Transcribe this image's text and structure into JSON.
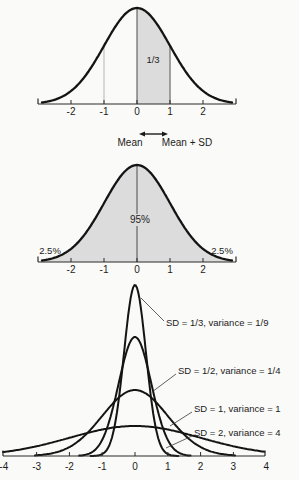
{
  "figure": {
    "background": "#fafaf8",
    "curve_color": "#141414",
    "shade_color": "#dcdcdc",
    "text_color": "#1c1c1c"
  },
  "panel1": {
    "area_label": "1/3",
    "mean_label": "Mean",
    "mean_plus_sd_label": "Mean + SD",
    "ticks": [
      "-2",
      "-1",
      "0",
      "1",
      "2"
    ]
  },
  "panel2": {
    "center_area_label": "95%",
    "left_tail_label": "2.5%",
    "right_tail_label": "2.5%",
    "ticks": [
      "-2",
      "-1",
      "0",
      "1",
      "2"
    ]
  },
  "panel3": {
    "curve_labels": [
      "SD = 1/3, variance = 1/9",
      "SD = 1/2, variance = 1/4",
      "SD = 1, variance = 1",
      "SD = 2, variance = 4"
    ],
    "ticks": [
      "-4",
      "-3",
      "-2",
      "-1",
      "0",
      "1",
      "2",
      "3",
      "4"
    ]
  },
  "chart_data": [
    {
      "type": "area",
      "title": "",
      "mean": 0,
      "sd": 1,
      "x_ticks": [
        -2,
        -1,
        0,
        1,
        2
      ],
      "shaded_region": {
        "from": 0,
        "to": 1,
        "area_label": "1/3"
      },
      "annotations": [
        "Mean",
        "Mean + SD"
      ],
      "grid": false
    },
    {
      "type": "area",
      "title": "",
      "mean": 0,
      "sd": 1,
      "x_ticks": [
        -2,
        -1,
        0,
        1,
        2
      ],
      "center_area_label": "95%",
      "tail_labels": [
        "2.5%",
        "2.5%"
      ],
      "grid": false
    },
    {
      "type": "line",
      "title": "",
      "x_ticks": [
        -4,
        -3,
        -2,
        -1,
        0,
        1,
        2,
        3,
        4
      ],
      "xlim": [
        -4,
        4
      ],
      "series": [
        {
          "name": "SD = 1/3, variance = 1/9",
          "mean": 0,
          "sd": 0.333,
          "variance": 0.111
        },
        {
          "name": "SD = 1/2, variance = 1/4",
          "mean": 0,
          "sd": 0.5,
          "variance": 0.25
        },
        {
          "name": "SD = 1, variance = 1",
          "mean": 0,
          "sd": 1,
          "variance": 1
        },
        {
          "name": "SD = 2, variance = 4",
          "mean": 0,
          "sd": 2,
          "variance": 4
        }
      ],
      "grid": false
    }
  ]
}
